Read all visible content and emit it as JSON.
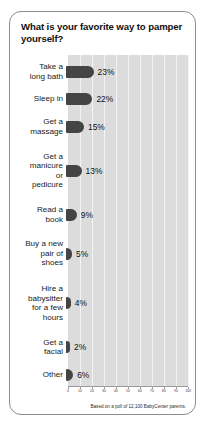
{
  "card": {
    "title": "What is your favorite way to pamper yourself?",
    "footnote": "Based on a poll of 12,100 BabyCenter parents."
  },
  "colors": {
    "bar": "#444444",
    "plot_background": "#dcdcdc",
    "gridline": "#f4f4f4",
    "card_border": "#8d8d8d",
    "text": "#101010"
  },
  "chart_data": {
    "type": "bar",
    "orientation": "horizontal",
    "title": "What is your favorite way to pamper yourself?",
    "xlabel": "",
    "ylabel": "",
    "xlim": [
      0,
      100
    ],
    "grid": true,
    "legend": null,
    "categories": [
      "Take a\nlong bath",
      "Sleep in",
      "Get a\nmassage",
      "Get a\nmanicure\nor\npedicure",
      "Read a\nbook",
      "Buy a new\npair of\nshoes",
      "Hire a\nbabysitter\nfor a few\nhours",
      "Get a\nfacial",
      "Other"
    ],
    "values": [
      23,
      22,
      15,
      13,
      9,
      5,
      4,
      2,
      6
    ],
    "value_labels": [
      "23%",
      "22%",
      "15%",
      "13%",
      "9%",
      "5%",
      "4%",
      "2%",
      "6%"
    ],
    "xticks": [
      0,
      10,
      20,
      30,
      40,
      50,
      60,
      70,
      80,
      90,
      100
    ],
    "xtick_labels": [
      "0",
      "10",
      "20",
      "30",
      "40",
      "50",
      "60",
      "70",
      "80",
      "90",
      "100"
    ],
    "annotation": "Based on a poll of 12,100 BabyCenter parents."
  }
}
